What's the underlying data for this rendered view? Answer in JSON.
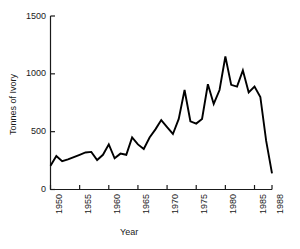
{
  "chart_data": {
    "type": "line",
    "title": "",
    "xlabel": "Year",
    "ylabel": "Tonnes of Ivory",
    "xlim": [
      1950,
      1988
    ],
    "ylim": [
      0,
      1500
    ],
    "grid": false,
    "legend": false,
    "line_color": "#000000",
    "axis_color": "#1a1a1a",
    "background_color": "#ffffff",
    "xticks": [
      1950,
      1955,
      1960,
      1965,
      1970,
      1975,
      1980,
      1985,
      1988
    ],
    "xtick_labels": [
      "1950",
      "1955",
      "1960",
      "1965",
      "1970",
      "1975",
      "1980",
      "1985",
      "1988"
    ],
    "yticks": [
      0,
      500,
      1000,
      1500
    ],
    "ytick_labels": [
      "0",
      "500",
      "1000",
      "1500"
    ],
    "x": [
      1950,
      1951,
      1952,
      1953,
      1954,
      1955,
      1956,
      1957,
      1958,
      1959,
      1960,
      1961,
      1962,
      1963,
      1964,
      1965,
      1966,
      1967,
      1968,
      1969,
      1970,
      1971,
      1972,
      1973,
      1974,
      1975,
      1976,
      1977,
      1978,
      1979,
      1980,
      1981,
      1982,
      1983,
      1984,
      1985,
      1986,
      1987,
      1988
    ],
    "values": [
      205,
      290,
      245,
      260,
      280,
      300,
      320,
      325,
      255,
      300,
      390,
      270,
      310,
      300,
      450,
      390,
      350,
      450,
      520,
      600,
      540,
      480,
      610,
      860,
      590,
      570,
      610,
      910,
      740,
      860,
      1150,
      905,
      890,
      1030,
      840,
      890,
      800,
      420,
      140
    ],
    "series": [
      {
        "name": "Tonnes of Ivory",
        "values": [
          205,
          290,
          245,
          260,
          280,
          300,
          320,
          325,
          255,
          300,
          390,
          270,
          310,
          300,
          450,
          390,
          350,
          450,
          520,
          600,
          540,
          480,
          610,
          860,
          590,
          570,
          610,
          910,
          740,
          860,
          1150,
          905,
          890,
          1030,
          840,
          890,
          800,
          420,
          140
        ]
      }
    ]
  },
  "axes": {
    "y_axis_label": "Tonnes of Ivory",
    "x_axis_label": "Year"
  }
}
